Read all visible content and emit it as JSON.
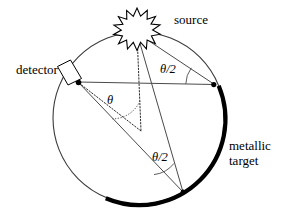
{
  "figure": {
    "type": "schematic-diagram",
    "background_color": "#ffffff",
    "stroke_color": "#000000"
  },
  "labels": {
    "source": "source",
    "detector": "detector",
    "target_line1": "metallic",
    "target_line2": "target",
    "angle_half_upper": "θ/2",
    "angle_half_lower": "θ/2",
    "angle_center": "θ"
  },
  "icons": {
    "source": "starburst-icon",
    "detector": "detector-box-icon"
  },
  "geometry": {
    "circle": {
      "cx": 139,
      "cy": 118,
      "r": 86
    },
    "points": {
      "source": {
        "x": 137,
        "y": 33
      },
      "detector": {
        "x": 78,
        "y": 82
      },
      "right_vertex": {
        "x": 213,
        "y": 84
      },
      "bottom_vertex": {
        "x": 183,
        "y": 192
      },
      "center": {
        "x": 139,
        "y": 118
      }
    },
    "target_arc": {
      "start_angle_deg": -22,
      "end_angle_deg": 112,
      "stroke_width": 4.2,
      "color": "#000000"
    }
  },
  "colors": {
    "outline": "#3a3a3a",
    "ray": "#4a4a4a",
    "target": "#000000",
    "text": "#000000"
  }
}
